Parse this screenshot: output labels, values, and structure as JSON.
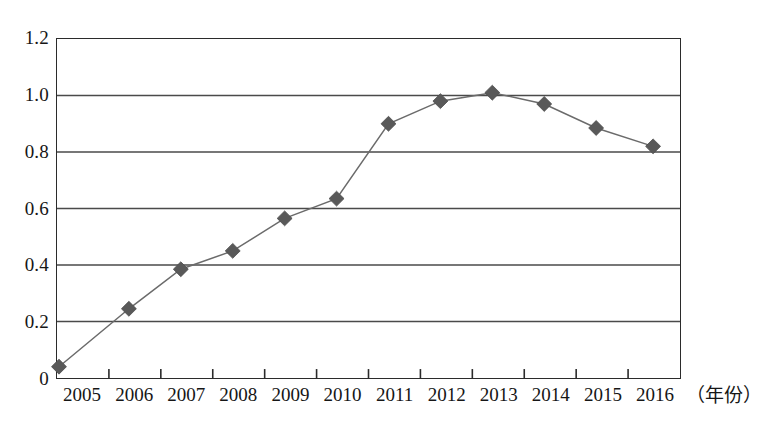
{
  "chart_data": {
    "type": "line",
    "title": "",
    "xlabel": "（年份）",
    "ylabel": "",
    "categories": [
      "2005",
      "2006",
      "2007",
      "2008",
      "2009",
      "2010",
      "2011",
      "2012",
      "2013",
      "2014",
      "2015",
      "2016"
    ],
    "values": [
      0.04,
      0.245,
      0.385,
      0.45,
      0.565,
      0.635,
      0.9,
      0.98,
      1.01,
      0.97,
      0.885,
      0.82
    ],
    "series": [
      {
        "name": "series-1",
        "values": [
          0.04,
          0.245,
          0.385,
          0.45,
          0.565,
          0.635,
          0.9,
          0.98,
          1.01,
          0.97,
          0.885,
          0.82
        ],
        "marker": "diamond",
        "color": "#595959",
        "line_color": "#6b6b6b"
      }
    ],
    "ylim": [
      0,
      1.2
    ],
    "yticks": [
      0,
      0.2,
      0.4,
      0.6,
      0.8,
      1.0,
      1.2
    ],
    "ytick_labels": [
      "0",
      "0.2",
      "0.4",
      "0.6",
      "0.8",
      "1.0",
      "1.2"
    ],
    "grid": true,
    "grid_axis": "y",
    "legend": false,
    "legend_position": "none",
    "axis_color": "#2b2b2b",
    "grid_color": "#4a4a4a",
    "background": "#ffffff"
  }
}
